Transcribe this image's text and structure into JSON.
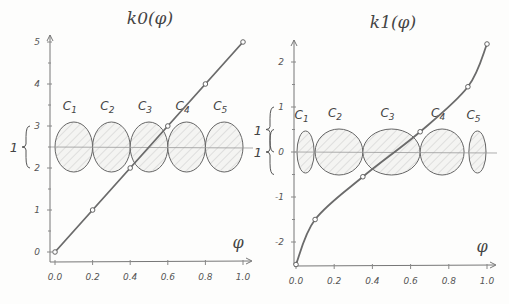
{
  "chart_data": [
    {
      "type": "line",
      "title": "k0(φ)",
      "xlabel": "φ",
      "ylabel": "",
      "x_ticks": [
        "0.0",
        "0.2",
        "0.4",
        "0.6",
        "0.8",
        "1.0"
      ],
      "y_ticks": [
        "0",
        "1",
        "2",
        "3",
        "4",
        "5"
      ],
      "xlim": [
        0.0,
        1.0
      ],
      "ylim": [
        0,
        5
      ],
      "x": [
        0.0,
        0.2,
        0.4,
        0.6,
        0.8,
        1.0
      ],
      "values": [
        0.0,
        1.0,
        2.0,
        3.0,
        4.0,
        5.0
      ],
      "brace_label": "1",
      "brace_range": [
        2,
        3
      ],
      "centerline_y": 2.5,
      "circles": [
        {
          "label": "C1",
          "sub": "1",
          "cx": 0.1,
          "rx": 0.1
        },
        {
          "label": "C2",
          "sub": "2",
          "cx": 0.3,
          "rx": 0.1
        },
        {
          "label": "C3",
          "sub": "3",
          "cx": 0.5,
          "rx": 0.1
        },
        {
          "label": "C4",
          "sub": "4",
          "cx": 0.7,
          "rx": 0.1
        },
        {
          "label": "C5",
          "sub": "5",
          "cx": 0.9,
          "rx": 0.1
        }
      ]
    },
    {
      "type": "line",
      "title": "k1(φ)",
      "xlabel": "φ",
      "ylabel": "",
      "x_ticks": [
        "0.0",
        "0.2",
        "0.4",
        "0.6",
        "0.8",
        "1.0"
      ],
      "y_ticks": [
        "-2",
        "-1",
        "0",
        "1",
        "2"
      ],
      "xlim": [
        0.0,
        1.0
      ],
      "ylim": [
        -2.5,
        2.5
      ],
      "x": [
        0.0,
        0.1,
        0.35,
        0.65,
        0.9,
        1.0
      ],
      "values": [
        -2.5,
        -1.5,
        -0.55,
        0.45,
        1.45,
        2.4
      ],
      "brace_labels": [
        {
          "label": "1",
          "range": [
            0,
            1
          ]
        },
        {
          "label": "1",
          "range": [
            -0.5,
            0.5
          ]
        }
      ],
      "centerline_y": 0,
      "circles": [
        {
          "label": "C1",
          "sub": "1",
          "cx": 0.05,
          "rx": 0.045
        },
        {
          "label": "C2",
          "sub": "2",
          "cx": 0.225,
          "rx": 0.125
        },
        {
          "label": "C3",
          "sub": "3",
          "cx": 0.5,
          "rx": 0.15
        },
        {
          "label": "C4",
          "sub": "4",
          "cx": 0.765,
          "rx": 0.115
        },
        {
          "label": "C5",
          "sub": "5",
          "cx": 0.95,
          "rx": 0.045
        }
      ]
    }
  ]
}
